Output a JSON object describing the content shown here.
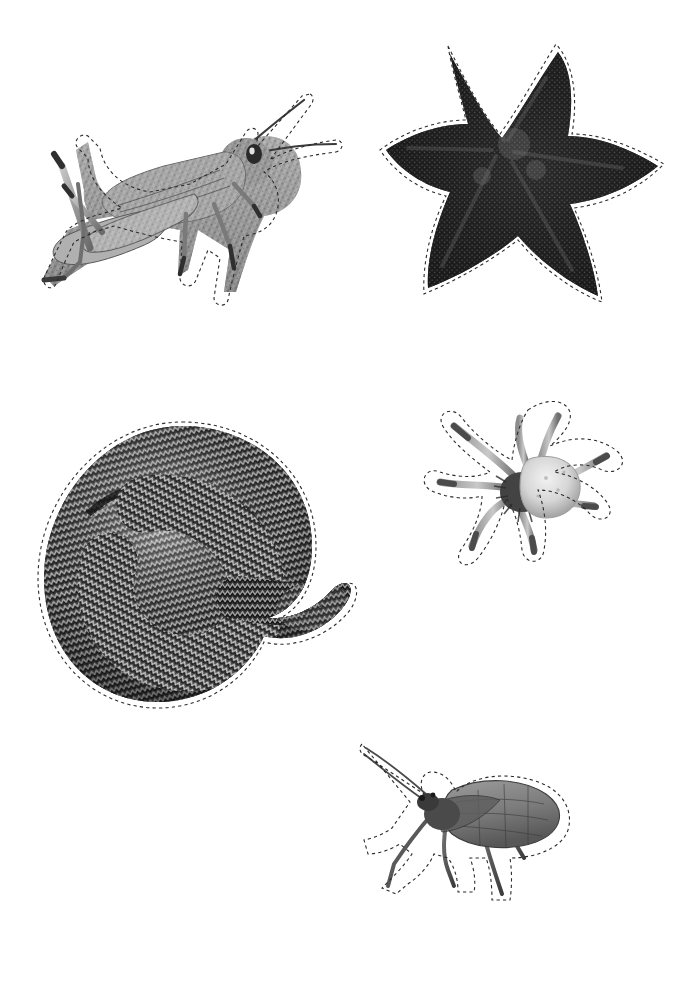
{
  "page": {
    "width": 696,
    "height": 982,
    "background_color": "#ffffff",
    "kind": "cut-out-activity-sheet",
    "cutline_color": "#2b2b2b",
    "cutline_style": "dashed"
  },
  "figures": [
    {
      "id": "grasshopper",
      "name": "grasshopper",
      "label": "Grasshopper",
      "group": "insect",
      "position": {
        "x": 38,
        "y": 80,
        "width": 306,
        "height": 245
      },
      "tone": "grayscale",
      "orientation": "facing-right",
      "notes": "Detailed side view with two long antennae, large hind jumping leg, banded abdomen"
    },
    {
      "id": "starfish",
      "name": "starfish",
      "label": "Starfish",
      "group": "echinoderm",
      "position": {
        "x": 386,
        "y": 44,
        "width": 278,
        "height": 258
      },
      "tone": "dark-grayscale",
      "orientation": "top-view",
      "notes": "Five-armed sea star with coarse granular texture, very dark body"
    },
    {
      "id": "snake",
      "name": "snake",
      "label": "Snake",
      "group": "reptile",
      "position": {
        "x": 40,
        "y": 422,
        "width": 318,
        "height": 300
      },
      "tone": "grayscale",
      "orientation": "coiled",
      "notes": "Coiled adder with zigzag dorsal scale pattern, head resting on coils"
    },
    {
      "id": "spider",
      "name": "spider",
      "label": "Spider",
      "group": "arachnid",
      "position": {
        "x": 424,
        "y": 400,
        "width": 200,
        "height": 188
      },
      "tone": "light-grayscale",
      "orientation": "top-view",
      "notes": "Crab spider with pale bulbous abdomen and eight outspread hairy legs"
    },
    {
      "id": "winged-insect",
      "name": "winged-insect",
      "label": "Winged insect",
      "group": "insect",
      "position": {
        "x": 358,
        "y": 740,
        "width": 220,
        "height": 160
      },
      "tone": "grayscale",
      "orientation": "facing-left",
      "notes": "Stonefly-like bug with broad veined wing, long antennae and slender legs"
    }
  ]
}
